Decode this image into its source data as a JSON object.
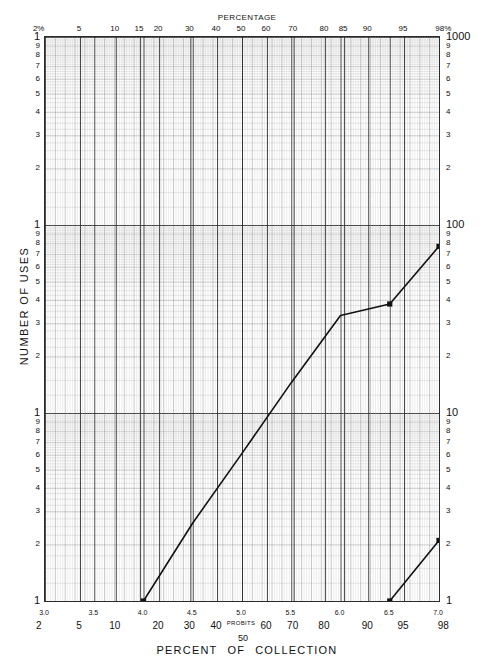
{
  "chart_data": {
    "type": "line",
    "top_axis_title": "PERCENTAGE",
    "ylabel": "NUMBER OF USES",
    "xlabel_probits": "PROBITS",
    "x_scale": "probit",
    "y_scale": "log3cycle",
    "ylim": [
      1,
      1000
    ],
    "probit_range": [
      3.0,
      7.0
    ],
    "grid": true,
    "legend": "none",
    "top_ticks": [
      {
        "label": "2%",
        "probit": 2.9463
      },
      {
        "label": "5",
        "probit": 3.3551
      },
      {
        "label": "10",
        "probit": 3.7184
      },
      {
        "label": "15",
        "probit": 3.9636
      },
      {
        "label": "20",
        "probit": 4.1584
      },
      {
        "label": "30",
        "probit": 4.4756
      },
      {
        "label": "40",
        "probit": 4.7467
      },
      {
        "label": "50",
        "probit": 5.0
      },
      {
        "label": "60",
        "probit": 5.2533
      },
      {
        "label": "70",
        "probit": 5.5244
      },
      {
        "label": "80",
        "probit": 5.8416
      },
      {
        "label": "85",
        "probit": 6.0364
      },
      {
        "label": "90",
        "probit": 6.2816
      },
      {
        "label": "95",
        "probit": 6.6449
      },
      {
        "label": "98%",
        "probit": 7.0537
      }
    ],
    "bottom_probit_ticks": [
      "3.0",
      "3.5",
      "4.0",
      "4.5",
      "5.0",
      "5.5",
      "6.0",
      "6.5",
      "7.0"
    ],
    "bottom_probit_values": [
      3.0,
      3.5,
      4.0,
      4.5,
      5.0,
      5.5,
      6.0,
      6.5,
      7.0
    ],
    "bottom_pct_ticks": [
      {
        "label": "2",
        "probit": 2.9463
      },
      {
        "label": "5",
        "probit": 3.3551
      },
      {
        "label": "10",
        "probit": 3.7184
      },
      {
        "label": "20",
        "probit": 4.1584
      },
      {
        "label": "30",
        "probit": 4.4756
      },
      {
        "label": "40",
        "probit": 4.7467
      },
      {
        "label": "PROBITS",
        "probit": 5.0
      },
      {
        "label": "60",
        "probit": 5.2533
      },
      {
        "label": "70",
        "probit": 5.5244
      },
      {
        "label": "80",
        "probit": 5.8416
      },
      {
        "label": "90",
        "probit": 6.2816
      },
      {
        "label": "95",
        "probit": 6.6449
      },
      {
        "label": "98",
        "probit": 7.0537
      }
    ],
    "center_pct_label": "50",
    "left_decade_labels": [
      "1",
      "9",
      "8",
      "7",
      "6",
      "5",
      "4",
      "3",
      "2"
    ],
    "right_decade_labels": [
      "1000",
      "9",
      "8",
      "7",
      "6",
      "5",
      "4",
      "3",
      "2",
      "100",
      "9",
      "8",
      "7",
      "6",
      "5",
      "4",
      "3",
      "2",
      "10",
      "9",
      "8",
      "7",
      "6",
      "5",
      "4",
      "3",
      "2",
      "1"
    ],
    "right_major_labels": [
      "1000",
      "100",
      "10",
      "1"
    ],
    "series": [
      {
        "name": "main-distribution-line",
        "color": "#111111",
        "points": [
          {
            "probit": 4.0,
            "uses": 1
          },
          {
            "probit": 4.5,
            "uses": 2.6
          },
          {
            "probit": 5.0,
            "uses": 6.1
          },
          {
            "probit": 5.5,
            "uses": 14.5
          },
          {
            "probit": 6.0,
            "uses": 33.0
          },
          {
            "probit": 6.5,
            "uses": 38.0
          },
          {
            "probit": 7.0,
            "uses": 77.0
          }
        ],
        "markers": [
          {
            "probit": 4.0,
            "uses": 1
          },
          {
            "probit": 6.5,
            "uses": 38.0
          },
          {
            "probit": 7.0,
            "uses": 77.0
          }
        ]
      },
      {
        "name": "secondary-short-line",
        "color": "#111111",
        "points": [
          {
            "probit": 6.5,
            "uses": 1
          },
          {
            "probit": 7.0,
            "uses": 2.1
          }
        ],
        "markers": [
          {
            "probit": 6.5,
            "uses": 1
          },
          {
            "probit": 7.0,
            "uses": 2.1
          }
        ]
      }
    ]
  },
  "labels": {
    "top_title": "PERCENTAGE",
    "y_axis_title": "NUMBER OF USES",
    "bottom_title_words": [
      "PERCENT",
      "OF",
      "COLLECTION"
    ],
    "center_fifty": "50"
  }
}
